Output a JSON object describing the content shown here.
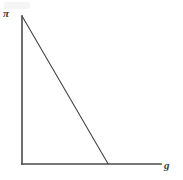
{
  "figure": {
    "background_color": "#ffffff",
    "line_color": "#444444",
    "axis_color": "#4a4a4a",
    "label_color": "#3b3b3b"
  },
  "axes": {
    "y_axis_label": "π",
    "x_axis_label": "g",
    "y_axis_name": "pi-axis",
    "x_axis_name": "g-axis"
  },
  "chart_data": {
    "type": "line",
    "title": "",
    "subtitle": "",
    "xlabel": "g",
    "ylabel": "π",
    "grid": false,
    "legend": false,
    "legend_position": "none",
    "xlim": [
      0,
      1
    ],
    "ylim": [
      0,
      1
    ],
    "x_tick_labels": [],
    "y_tick_labels": [],
    "annotations": [],
    "series": [
      {
        "name": "profit-growth-locus",
        "style": "solid",
        "color": "#444444",
        "x": [
          0,
          0.62
        ],
        "y": [
          1.0,
          0
        ],
        "description": "Downward sloping straight line from the vertical axis intercept to the horizontal axis"
      }
    ]
  }
}
